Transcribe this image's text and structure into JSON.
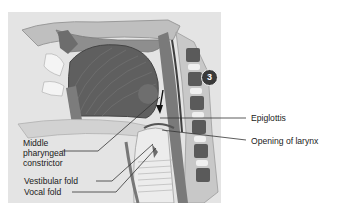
{
  "figure": {
    "step_badge": "3",
    "labels": {
      "middle_pharyngeal_constrictor": [
        "Middle",
        "pharyngeal",
        "constrictor"
      ],
      "vestibular_fold": "Vestibular fold",
      "vocal_fold": "Vocal fold",
      "epiglottis": "Epiglottis",
      "opening_of_larynx": "Opening of larynx"
    }
  }
}
